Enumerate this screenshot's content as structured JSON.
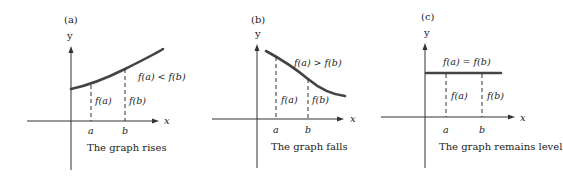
{
  "panels": [
    {
      "id": "a",
      "tag": "(a)",
      "y_axis_label": "y",
      "x_axis_label": "x",
      "tick_a": "a",
      "tick_b": "b",
      "seg_a_label": "f(a)",
      "seg_b_label": "f(b)",
      "relation": "f(a) < f(b)",
      "caption": "The graph rises",
      "behavior": "increasing"
    },
    {
      "id": "b",
      "tag": "(b)",
      "y_axis_label": "y",
      "x_axis_label": "x",
      "tick_a": "a",
      "tick_b": "b",
      "seg_a_label": "f(a)",
      "seg_b_label": "f(b)",
      "relation": "f(a) > f(b)",
      "caption": "The graph falls",
      "behavior": "decreasing"
    },
    {
      "id": "c",
      "tag": "(c)",
      "y_axis_label": "y",
      "x_axis_label": "x",
      "tick_a": "a",
      "tick_b": "b",
      "seg_a_label": "f(a)",
      "seg_b_label": "f(b)",
      "relation": "f(a) = f(b)",
      "caption": "The graph remains level",
      "behavior": "constant"
    }
  ],
  "colors": {
    "curve": "#444444",
    "axis": "#333333",
    "text": "#222222"
  }
}
